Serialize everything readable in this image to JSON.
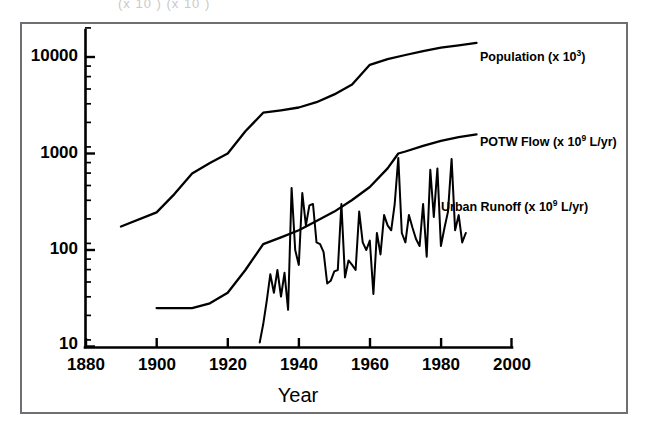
{
  "figure": {
    "top_crop_text": "(x 10 ) (x 10 )",
    "background": "#ffffff",
    "frame_color": "#6e6e73",
    "ink_color": "#000000"
  },
  "axis": {
    "x_title": "Year",
    "y_title": "",
    "x_ticks": [
      "1880",
      "1900",
      "1920",
      "1940",
      "1960",
      "1980",
      "2000"
    ],
    "y_ticks": [
      "10",
      "100",
      "1000",
      "10000"
    ]
  },
  "series_labels": {
    "population": {
      "text": "Population (x 10",
      "sup": "3",
      "tail": ")"
    },
    "potw": {
      "text": "POTW Flow (x 10",
      "sup": "9",
      "tail": " L/yr)"
    },
    "runoff": {
      "text": "Urban Runoff (x 10",
      "sup": "9",
      "tail": " L/yr)"
    }
  },
  "chart_data": {
    "type": "line",
    "title": "",
    "subtitle": "",
    "xlabel": "Year",
    "ylabel": "",
    "xlim": [
      1880,
      2000
    ],
    "ylim": [
      8,
      20000
    ],
    "yscale": "log",
    "grid": false,
    "legend_position": "inline-right",
    "xticks": [
      1880,
      1900,
      1920,
      1940,
      1960,
      1980,
      2000
    ],
    "yticks": [
      10,
      100,
      1000,
      10000
    ],
    "yminor_ticks": true,
    "annotations": [
      {
        "text": "Population (x 10^3)",
        "x": 1988,
        "y": 14000
      },
      {
        "text": "POTW Flow (x 10^9 L/yr)",
        "x": 1988,
        "y": 1600
      },
      {
        "text": "Urban Runoff (x 10^9 L/yr)",
        "x": 1975,
        "y": 175
      }
    ],
    "series": [
      {
        "name": "Population (x 10^3)",
        "units": "thousands",
        "x": [
          1890,
          1900,
          1905,
          1910,
          1915,
          1920,
          1925,
          1930,
          1935,
          1940,
          1945,
          1950,
          1955,
          1960,
          1965,
          1970,
          1975,
          1980,
          1985,
          1990
        ],
        "values": [
          175,
          245,
          380,
          620,
          800,
          1000,
          1700,
          2650,
          2800,
          3000,
          3400,
          4100,
          5200,
          8300,
          9500,
          10500,
          11500,
          12500,
          13200,
          14000
        ]
      },
      {
        "name": "POTW Flow (x 10^9 L/yr)",
        "units": "10^9 L/yr",
        "x": [
          1900,
          1905,
          1910,
          1915,
          1920,
          1925,
          1930,
          1935,
          1940,
          1945,
          1950,
          1955,
          1960,
          1965,
          1968,
          1970,
          1975,
          1980,
          1985,
          1990
        ],
        "values": [
          25,
          25,
          25,
          28,
          36,
          62,
          115,
          135,
          160,
          200,
          250,
          330,
          450,
          700,
          1000,
          1050,
          1200,
          1350,
          1480,
          1580
        ]
      },
      {
        "name": "Urban Runoff (x 10^9 L/yr)",
        "units": "10^9 L/yr",
        "x": [
          1929,
          1930,
          1931,
          1932,
          1933,
          1934,
          1935,
          1936,
          1937,
          1938,
          1939,
          1940,
          1941,
          1942,
          1943,
          1944,
          1945,
          1946,
          1947,
          1948,
          1949,
          1950,
          1951,
          1952,
          1953,
          1954,
          1955,
          1956,
          1957,
          1958,
          1959,
          1960,
          1961,
          1962,
          1963,
          1964,
          1965,
          1966,
          1967,
          1968,
          1969,
          1970,
          1971,
          1972,
          1973,
          1974,
          1975,
          1976,
          1977,
          1978,
          1979,
          1980,
          1981,
          1982,
          1983,
          1984,
          1985,
          1986,
          1987
        ],
        "values": [
          11,
          17,
          30,
          56,
          36,
          62,
          33,
          58,
          24,
          440,
          100,
          70,
          390,
          180,
          290,
          300,
          120,
          115,
          95,
          45,
          48,
          60,
          62,
          300,
          52,
          78,
          70,
          62,
          250,
          120,
          100,
          125,
          35,
          150,
          90,
          230,
          180,
          160,
          300,
          900,
          150,
          120,
          230,
          170,
          130,
          110,
          300,
          85,
          680,
          220,
          700,
          110,
          170,
          250,
          880,
          160,
          230,
          120,
          150
        ]
      }
    ]
  }
}
